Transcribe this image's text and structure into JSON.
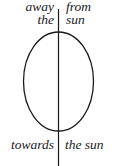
{
  "diagram": {
    "labels": {
      "top_left_line1": "away",
      "top_left_line2": "the",
      "top_right_line1": "from",
      "top_right_line2": "sun",
      "bottom_left": "towards",
      "bottom_right": "the sun"
    },
    "colors": {
      "stroke": "#1a1a1a",
      "background": "#ffffff"
    }
  }
}
